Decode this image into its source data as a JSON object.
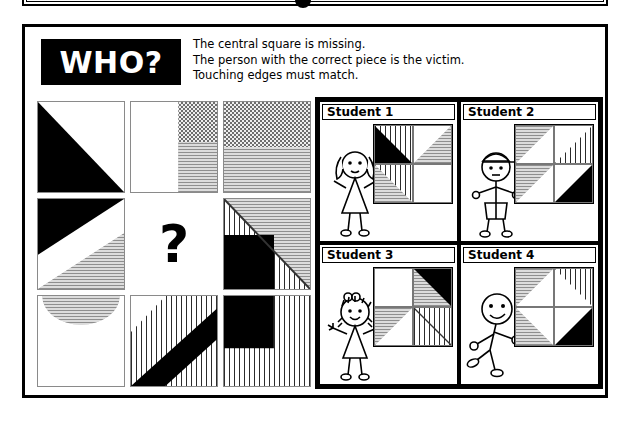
{
  "header": {
    "badge_label": "WHO?",
    "instructions": [
      "The central square is missing.",
      "The person with the correct piece is the victim.",
      "Touching edges must match."
    ]
  },
  "puzzle": {
    "missing_marker": "?",
    "rows": 3,
    "cols": 3,
    "cells": [
      {
        "id": "cell-r1c1",
        "position": "row1-col1",
        "description": "black triangle lower-left on white"
      },
      {
        "id": "cell-r1c2",
        "position": "row1-col2",
        "description": "white left band; checkered top-right; horizontal-lines bottom-right"
      },
      {
        "id": "cell-r1c3",
        "position": "row1-col3",
        "description": "checkered top half; horizontal-lines bottom half"
      },
      {
        "id": "cell-r2c1",
        "position": "row2-col1",
        "description": "black diagonal band top-left, white middle band, horizontal-lines lower-right"
      },
      {
        "id": "cell-r2c2",
        "position": "row2-col2",
        "description": "missing centre square marked with question mark"
      },
      {
        "id": "cell-r2c3",
        "position": "row2-col3",
        "description": "horizontal-lines upper-right triangle, vertical-dash lower-left, black square lower-left quadrant"
      },
      {
        "id": "cell-r3c1",
        "position": "row3-col1",
        "description": "white with horizontal-lines semicircle hanging from top edge"
      },
      {
        "id": "cell-r3c2",
        "position": "row3-col2",
        "description": "white corner top-left, black diagonal band, vertical dashes"
      },
      {
        "id": "cell-r3c3",
        "position": "row3-col3",
        "description": "vertical dashes with black square in top-left quadrant"
      }
    ]
  },
  "students": [
    {
      "label": "Student 1",
      "figure": "girl-pigtails",
      "piece_description": "vertical dashes with black triangle; grey horizontal-line triangles; one white quadrant"
    },
    {
      "label": "Student 2",
      "figure": "boy-cap",
      "piece_description": "grey horizontal-line and vertical-dash chevron with black lower-right triangle"
    },
    {
      "label": "Student 3",
      "figure": "girl-bow",
      "piece_description": "white quadrant, grey and black triangles, vertical-dash quadrant"
    },
    {
      "label": "Student 4",
      "figure": "boy-running",
      "piece_description": "double chevron, grey horizontal lines left, vertical dashes top-right, black lower-right triangle"
    }
  ],
  "colors": {
    "ink": "#000000",
    "grey_fill": "#c9c9c9",
    "grey_line": "#8e8e8e",
    "paper": "#ffffff"
  }
}
